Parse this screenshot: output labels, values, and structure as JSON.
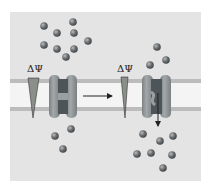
{
  "diagram": {
    "type": "voltage-gated-ion-channel",
    "colors": {
      "panel": "#e4e4e4",
      "membrane_band": "#f4f4f4",
      "membrane_line": "#bcbcbc",
      "channel_body": "#8f9598",
      "channel_pore": "#4e5558",
      "ion": "#6b6f72",
      "triangle": "#8a9089",
      "arrow": "#222222"
    },
    "labels": {
      "left_potential": "ΔΨ",
      "right_potential": "ΔΨ"
    },
    "states": [
      {
        "name": "closed",
        "gradient": "large",
        "channel": "closed"
      },
      {
        "name": "open",
        "gradient": "small",
        "channel": "open"
      }
    ],
    "ions": {
      "left_above": [
        [
          44,
          26
        ],
        [
          73,
          22
        ],
        [
          57,
          33
        ],
        [
          74,
          33
        ],
        [
          88,
          41
        ],
        [
          44,
          45
        ],
        [
          57,
          49
        ],
        [
          74,
          49
        ],
        [
          66,
          57
        ]
      ],
      "left_below": [
        [
          71,
          129
        ],
        [
          55,
          136
        ],
        [
          63,
          149
        ]
      ],
      "right_above": [
        [
          157,
          47
        ],
        [
          166,
          60
        ],
        [
          150,
          65
        ]
      ],
      "right_below": [
        [
          143,
          134
        ],
        [
          173,
          136
        ],
        [
          160,
          141
        ],
        [
          137,
          154
        ],
        [
          151,
          153
        ],
        [
          172,
          155
        ],
        [
          163,
          168
        ]
      ]
    }
  }
}
